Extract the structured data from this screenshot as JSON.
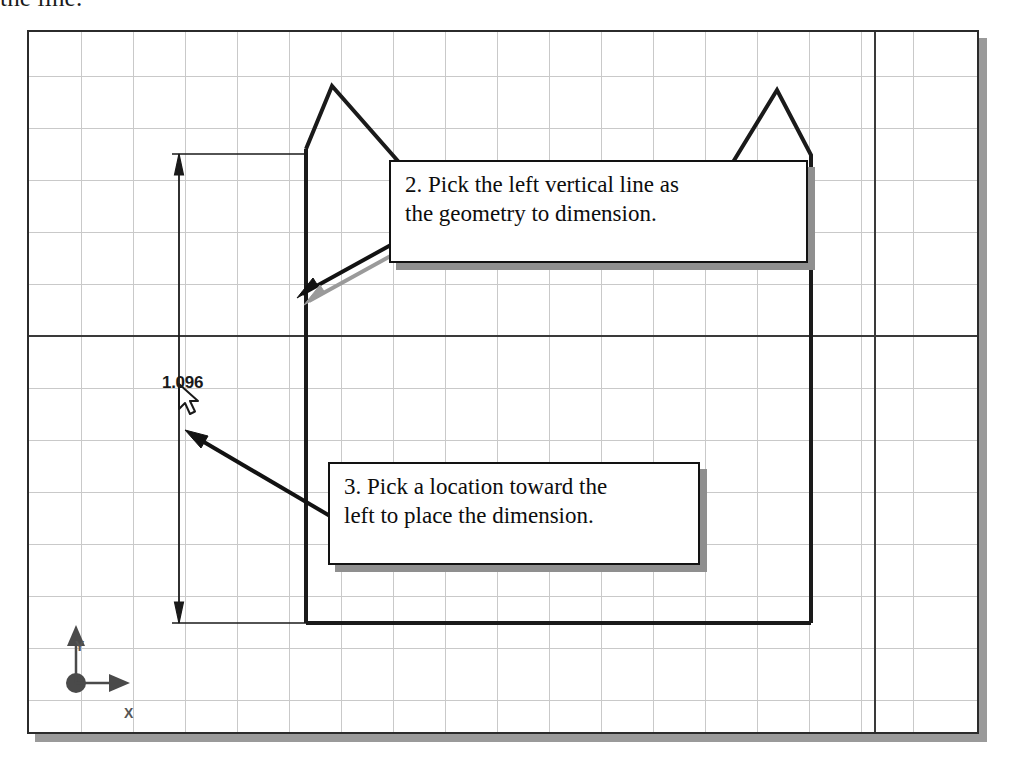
{
  "caption": {
    "text": "the line."
  },
  "cad_window": {
    "name": "cad-drawing-viewport",
    "grid_spacing_px": 52,
    "background_color": "#ffffff",
    "grid_color": "#c9c9c9",
    "axis_color": "#3a3a3a",
    "border_color": "#2b2b2b",
    "shadow_color": "#9a9a9a"
  },
  "dimension": {
    "label": "1.096",
    "type": "vertical-linear",
    "arrow_style": "filled-closed"
  },
  "origin_marker": {
    "y_label": "Y",
    "x_label": "X",
    "color": "#555555"
  },
  "callouts": [
    {
      "id": "callout-2",
      "line1": "2. Pick the left vertical line as",
      "line2": "the geometry to dimension."
    },
    {
      "id": "callout-3",
      "line1": "3. Pick a location toward the",
      "line2": "left to place the dimension."
    }
  ],
  "geometry": {
    "name": "house-profile-sketch",
    "stroke_color": "#1a1a1a"
  },
  "cursor": {
    "name": "arrow-pointer",
    "x": 176,
    "y": 380
  }
}
